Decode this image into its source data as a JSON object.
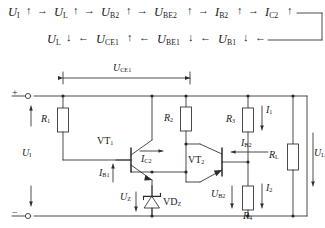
{
  "figure": {
    "kind": "circuit-diagram",
    "title_text": "",
    "ink_color": "#2b2b2b",
    "bg_color": "#ffffff"
  },
  "flow": {
    "line1": {
      "items": [
        {
          "symbol": "U",
          "sub": "I",
          "dir": "up"
        },
        {
          "symbol": "U",
          "sub": "L",
          "dir": "up"
        },
        {
          "symbol": "U",
          "sub": "B2",
          "dir": "up"
        },
        {
          "symbol": "U",
          "sub": "BE2",
          "dir": "up"
        },
        {
          "symbol": "I",
          "sub": "B2",
          "dir": "up"
        },
        {
          "symbol": "I",
          "sub": "C2",
          "dir": "up"
        }
      ],
      "connector": "arrow-right",
      "tail": "line-right"
    },
    "line2": {
      "items": [
        {
          "symbol": "U",
          "sub": "L",
          "dir": "down"
        },
        {
          "symbol": "U",
          "sub": "CE1",
          "dir": "up"
        },
        {
          "symbol": "U",
          "sub": "BE1",
          "dir": "down"
        },
        {
          "symbol": "U",
          "sub": "B1",
          "dir": "down"
        }
      ],
      "connector": "arrow-left",
      "tail": "line-right"
    },
    "arrow_up": "↑",
    "arrow_down": "↓",
    "arrow_right": "→",
    "arrow_left": "←"
  },
  "circuit": {
    "terminals": [
      {
        "name": "input-positive",
        "label": "+"
      },
      {
        "name": "input-negative",
        "label": "−"
      }
    ],
    "resistors": [
      {
        "id": "R1",
        "symbol": "R",
        "sub": "1"
      },
      {
        "id": "R2",
        "symbol": "R",
        "sub": "2"
      },
      {
        "id": "R3",
        "symbol": "R",
        "sub": "3"
      },
      {
        "id": "R4",
        "symbol": "R",
        "sub": "4"
      },
      {
        "id": "RL",
        "symbol": "R",
        "sub": "L"
      }
    ],
    "transistors": [
      {
        "id": "VT1",
        "symbol": "VT",
        "sub": "1",
        "type": "npn"
      },
      {
        "id": "VT2",
        "symbol": "VT",
        "sub": "2",
        "type": "npn"
      }
    ],
    "diodes": [
      {
        "id": "VDZ",
        "symbol": "VD",
        "sub": "Z",
        "type": "zener"
      }
    ],
    "voltages": [
      {
        "id": "UI",
        "symbol": "U",
        "sub": "I",
        "name": "input-voltage"
      },
      {
        "id": "UCE1",
        "symbol": "U",
        "sub": "CE1",
        "name": "vt1-collector-emitter-voltage"
      },
      {
        "id": "UZ",
        "symbol": "U",
        "sub": "Z",
        "name": "zener-voltage"
      },
      {
        "id": "UB2",
        "symbol": "U",
        "sub": "B2",
        "name": "vt2-base-voltage"
      },
      {
        "id": "UL",
        "symbol": "U",
        "sub": "L",
        "name": "load-voltage"
      }
    ],
    "currents": [
      {
        "id": "IB1",
        "symbol": "I",
        "sub": "B1",
        "name": "vt1-base-current",
        "dir": "up"
      },
      {
        "id": "IC2",
        "symbol": "I",
        "sub": "C2",
        "name": "vt2-collector-current",
        "dir": "right"
      },
      {
        "id": "IB2",
        "symbol": "I",
        "sub": "B2",
        "name": "vt2-base-current",
        "dir": "left"
      },
      {
        "id": "I1",
        "symbol": "I",
        "sub": "1",
        "name": "divider-current-upper",
        "dir": "down"
      },
      {
        "id": "I2",
        "symbol": "I",
        "sub": "2",
        "name": "divider-current-lower",
        "dir": "down"
      }
    ]
  }
}
